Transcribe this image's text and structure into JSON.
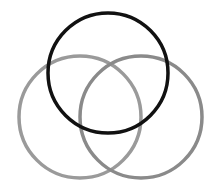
{
  "diagram": {
    "type": "venn",
    "background": "#ffffff",
    "circles": [
      {
        "name": "top",
        "cx": 108,
        "cy": 73,
        "r": 60,
        "stroke": "#111111",
        "width": 3.5
      },
      {
        "name": "left",
        "cx": 80,
        "cy": 117,
        "r": 61,
        "stroke": "#9a9a9a",
        "width": 3.5
      },
      {
        "name": "right",
        "cx": 141,
        "cy": 117,
        "r": 61,
        "stroke": "#8a8a8a",
        "width": 3.5
      }
    ]
  }
}
